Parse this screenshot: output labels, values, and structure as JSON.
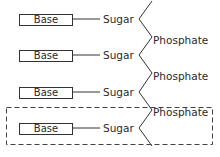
{
  "diagram": {
    "type": "nucleic-acid-strand-schematic",
    "rows": [
      {
        "base": "Base",
        "sugar": "Sugar"
      },
      {
        "base": "Base",
        "sugar": "Sugar"
      },
      {
        "base": "Base",
        "sugar": "Sugar"
      },
      {
        "base": "Base",
        "sugar": "Sugar"
      }
    ],
    "phosphates": [
      "Phosphate",
      "Phosphate",
      "Phosphate"
    ],
    "highlight": {
      "style": "dashed-box",
      "encloses": "nucleotide (Base–Sugar–Phosphate)"
    },
    "colors": {
      "line": "#333333",
      "background": "#ffffff",
      "text": "#2a2a2a"
    }
  }
}
